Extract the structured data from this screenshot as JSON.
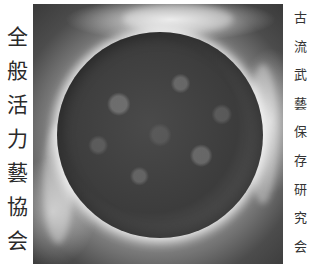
{
  "left_title": {
    "text": "全般活力藝協会",
    "chars": [
      "全",
      "般",
      "活",
      "力",
      "藝",
      "協",
      "会"
    ]
  },
  "right_title": {
    "text": "古流武藝保存研究会",
    "chars": [
      "古",
      "流",
      "武",
      "藝",
      "保",
      "存",
      "研",
      "究",
      "会"
    ]
  },
  "artwork": {
    "description": "dark mottled sphere surrounded by white energy glow",
    "colors": {
      "sphere": "#3c3c3c",
      "glow": "#f2f2f2",
      "background_edge": "#3a3a3a"
    }
  }
}
